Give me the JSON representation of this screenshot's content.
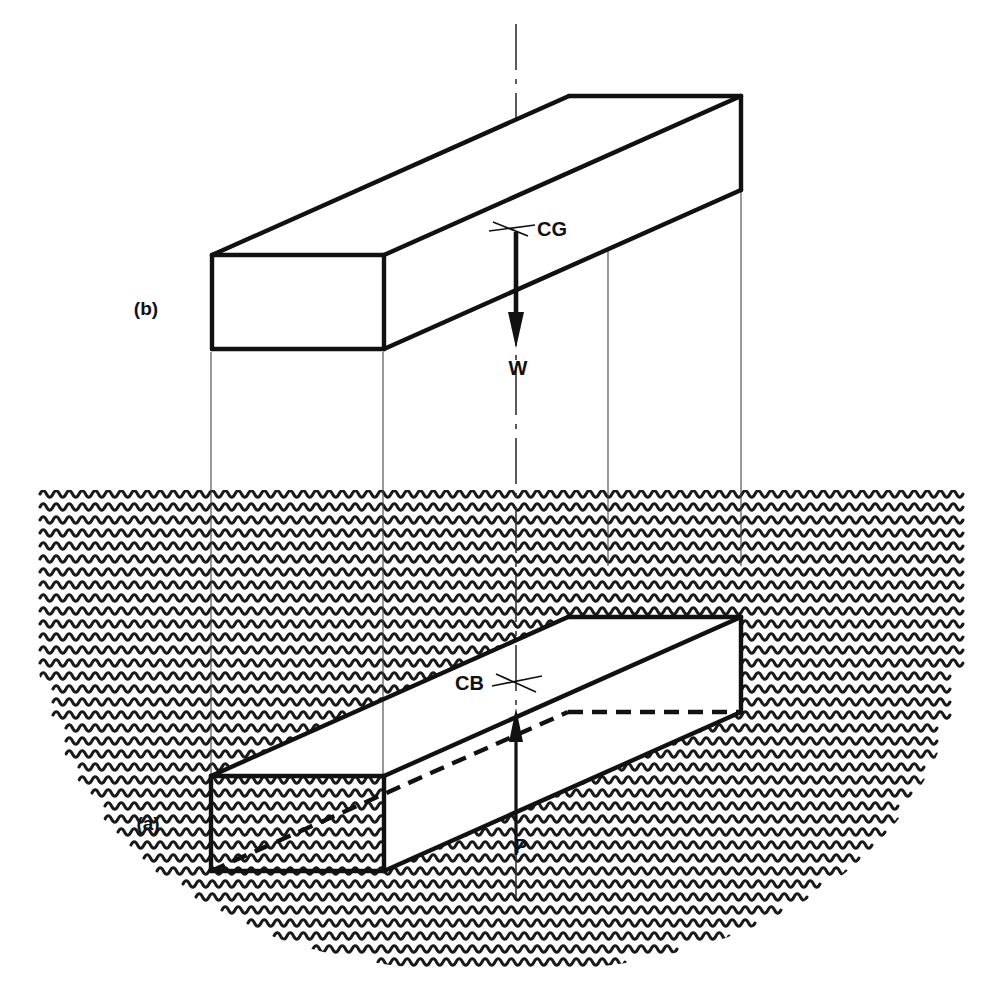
{
  "figure": {
    "background_color": "#ffffff",
    "ink_color": "#111111",
    "water_color": "#1a1a1a",
    "width": 1001,
    "height": 1001
  },
  "panels": [
    {
      "key": "a",
      "label": "(a)",
      "caption_x": 146,
      "caption_y": 824,
      "description": "submerged block in water"
    },
    {
      "key": "b",
      "label": "(b)",
      "caption_x": 146,
      "caption_y": 308,
      "description": "block above water"
    }
  ],
  "labels": {
    "panel_a": "(a)",
    "panel_b": "(b)",
    "center_of_gravity": "CG",
    "center_of_buoyancy": "CB",
    "weight_force": "W",
    "buoyant_force": "P"
  },
  "forces": [
    {
      "name": "weight",
      "symbol": "W",
      "direction": "down",
      "origin": "CG",
      "x": 516,
      "y_start": 232,
      "y_end": 344,
      "label_x": 518,
      "label_y": 372
    },
    {
      "name": "buoyancy",
      "symbol": "P",
      "direction": "up",
      "origin": "CB",
      "x": 516,
      "y_start": 855,
      "y_end": 712,
      "label_x": 521,
      "label_y": 851
    }
  ],
  "markers": [
    {
      "name": "CG",
      "x": 516,
      "y": 228,
      "label_side": "right",
      "label_x": 537,
      "label_y": 235
    },
    {
      "name": "CB",
      "x": 516,
      "y": 682,
      "label_side": "left",
      "label_x": 466,
      "label_y": 689
    }
  ],
  "centerline": {
    "style": "dash-dot",
    "x": 516,
    "y_start": 24,
    "y_end": 905
  },
  "projection_lines": [
    {
      "x": 211,
      "y_start": 352,
      "y_end": 790
    },
    {
      "x": 383,
      "y_start": 352,
      "y_end": 790
    },
    {
      "x": 608,
      "y_start": 182,
      "y_end": 566
    },
    {
      "x": 741,
      "y_start": 182,
      "y_end": 566
    }
  ],
  "water": {
    "surface_y": 490,
    "left_x": 27,
    "right_x": 975,
    "bottom_y": 975,
    "row_spacing": 13,
    "wave_amplitude": 3.2,
    "wave_period": 13,
    "shape": "elliptical-bowl"
  },
  "blocks": [
    {
      "key": "b",
      "name": "block-above-water",
      "front_face": {
        "left_x": 212,
        "right_x": 384,
        "top_y": 255,
        "bottom_y": 349
      },
      "depth_dx": 357,
      "depth_dy": -159,
      "hidden_edges": false,
      "fill": "white"
    },
    {
      "key": "a",
      "name": "block-submerged",
      "front_face": {
        "left_x": 211,
        "right_x": 384,
        "top_y": 776,
        "bottom_y": 871
      },
      "depth_dx": 357,
      "depth_dy": -159,
      "hidden_edges": true,
      "fill": "transparent-top-white"
    }
  ]
}
